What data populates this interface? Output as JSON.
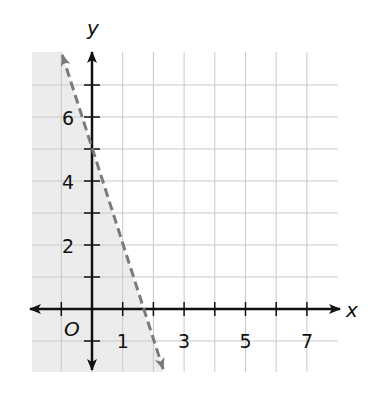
{
  "chart_data": {
    "type": "line",
    "title": "",
    "xlabel": "x",
    "ylabel": "y",
    "origin_label": "O",
    "xlim": [
      -2,
      7.5
    ],
    "ylim": [
      -2,
      8
    ],
    "grid": true,
    "x_tick_labels": [
      "1",
      "3",
      "5",
      "7"
    ],
    "x_tick_label_values": [
      1,
      3,
      5,
      7
    ],
    "y_tick_labels": [
      "2",
      "4",
      "6"
    ],
    "y_tick_label_values": [
      2,
      4,
      6
    ],
    "boundary_line": {
      "equation": "y = -3x + 5",
      "slope": -3,
      "intercept": 5,
      "style": "dashed",
      "color": "#7a7a7a",
      "points": [
        [
          -1,
          8
        ],
        [
          0,
          5
        ],
        [
          1.67,
          0
        ],
        [
          2.25,
          -1.75
        ]
      ]
    },
    "shaded_region": {
      "inequality": "y < -3x + 5",
      "side": "left/below line",
      "color": "#ececec"
    }
  },
  "colors": {
    "axis": "#111111",
    "grid": "#c8c8c8",
    "shade": "#ececec",
    "dashed_line": "#7a7a7a"
  }
}
